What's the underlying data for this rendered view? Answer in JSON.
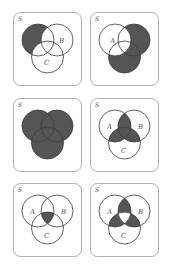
{
  "colors": {
    "shade": "#555555",
    "frame": "#9a9a9a",
    "circle": "#3a3a3a"
  },
  "labels": {
    "universe": "S",
    "a": "A",
    "b": "B",
    "c": "C"
  },
  "panels": [
    {
      "id": 1,
      "shaded_regions": "A only (A − (B ∪ C))"
    },
    {
      "id": 2,
      "shaded_regions": "(B ∪ C) − A"
    },
    {
      "id": 3,
      "shaded_regions": "A ∪ B ∪ C"
    },
    {
      "id": 4,
      "shaded_regions": "(A∩B) ∪ (A∩C) ∪ (B∩C)"
    },
    {
      "id": 5,
      "shaded_regions": "A ∩ B ∩ C"
    },
    {
      "id": 6,
      "shaded_regions": "exactly two of A, B, C"
    }
  ]
}
